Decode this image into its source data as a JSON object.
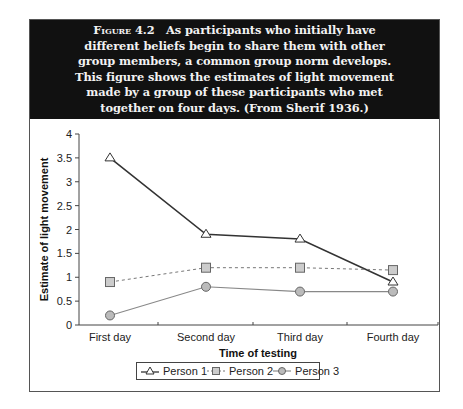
{
  "caption": {
    "figure_label": "Figure 4.2",
    "lines": [
      "As participants who initially have",
      "different beliefs begin to share them with other",
      "group members, a common group norm develops.",
      "This figure shows the estimates of light movement",
      "made by a group of these participants who met",
      "together on four days. (From Sherif 1936.)"
    ]
  },
  "chart_data": {
    "type": "line",
    "title": "",
    "xlabel": "Time of testing",
    "ylabel": "Estimate of light movement",
    "categories": [
      "First day",
      "Second day",
      "Third day",
      "Fourth day"
    ],
    "ylim": [
      0,
      4
    ],
    "yticks": [
      "0",
      "0.5",
      "1",
      "1.5",
      "2",
      "2.5",
      "3",
      "3.5",
      "4"
    ],
    "grid": false,
    "legend_position": "bottom",
    "series": [
      {
        "name": "Person 1",
        "marker": "triangle",
        "line": "solid-dark",
        "values": [
          3.5,
          1.9,
          1.8,
          0.9
        ]
      },
      {
        "name": "Person 2",
        "marker": "square",
        "line": "dashed",
        "values": [
          0.9,
          1.2,
          1.2,
          1.15
        ]
      },
      {
        "name": "Person 3",
        "marker": "circle",
        "line": "solid-light",
        "values": [
          0.2,
          0.8,
          0.7,
          0.7
        ]
      }
    ]
  },
  "legend": {
    "items": [
      "Person 1",
      "Person 2",
      "Person 3"
    ]
  }
}
